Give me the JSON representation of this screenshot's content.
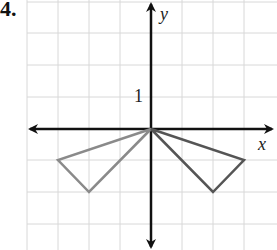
{
  "problem_number": "4.",
  "axes": {
    "x_label": "x",
    "y_label": "y",
    "tick_label": "1"
  },
  "grid": {
    "origin_px": [
      151,
      129
    ],
    "unit_px": 31,
    "x_range": [
      -4,
      4
    ],
    "y_range": [
      -3,
      4
    ]
  },
  "shapes": [
    {
      "name": "left-triangle",
      "vertices": [
        [
          0,
          0
        ],
        [
          -3,
          -1
        ],
        [
          -2,
          -2
        ]
      ],
      "color": "#8a8a8a"
    },
    {
      "name": "right-triangle",
      "vertices": [
        [
          0,
          0
        ],
        [
          3,
          -1
        ],
        [
          2,
          -2
        ]
      ],
      "color": "#555555"
    }
  ]
}
